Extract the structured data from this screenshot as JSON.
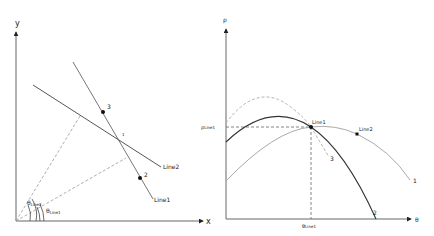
{
  "left_panel": {
    "axes": {
      "x_label": "x",
      "y_label": "y"
    },
    "lines": [
      {
        "name": "Line1",
        "label": "Line1"
      },
      {
        "name": "Line2",
        "label": "Line2"
      }
    ],
    "points": [
      {
        "id": "1",
        "label": "1"
      },
      {
        "id": "2",
        "label": "2"
      },
      {
        "id": "3",
        "label": "3"
      }
    ],
    "angles": [
      {
        "symbol": "θ",
        "subscript": "Line2"
      },
      {
        "symbol": "θ",
        "subscript": "Line1"
      }
    ]
  },
  "right_panel": {
    "axes": {
      "x_label": "θ",
      "y_label": "ρ"
    },
    "markers": [
      {
        "label": "Line1"
      },
      {
        "label": "Line2"
      }
    ],
    "curves": [
      {
        "id": "1",
        "label": "1",
        "style": "solid-light"
      },
      {
        "id": "2",
        "label": "2",
        "style": "solid-dark"
      },
      {
        "id": "3",
        "label": "3",
        "style": "dashed-light"
      }
    ],
    "guides": {
      "rho_symbol": "ρ",
      "rho_subscript": "Line1",
      "theta_symbol": "θ",
      "theta_subscript": "Line1"
    }
  },
  "colors": {
    "axis": "#444444",
    "dark_curve": "#333333",
    "light_curve": "#aaaaaa",
    "dashed": "#888888",
    "point": "#111111"
  }
}
